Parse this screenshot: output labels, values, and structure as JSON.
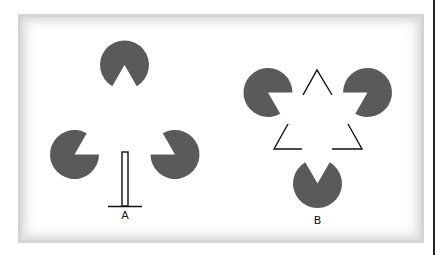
{
  "figure": {
    "colors": {
      "inducer_fill": "#5a5a5a",
      "line": "#111111",
      "frame_border": "#d4d4d4",
      "background": "#ffffff"
    },
    "panels": [
      {
        "id": "A",
        "label": "A",
        "description": "Three pac-man inducers arranged in a triangle around a T-shaped stem",
        "inducers": [
          {
            "cx": 124.5,
            "cy": 65,
            "r": 24.5,
            "mouth_from_deg": 240,
            "mouth_to_deg": 300
          },
          {
            "cx": 74.5,
            "cy": 154.5,
            "r": 24.5,
            "mouth_from_deg": 0,
            "mouth_to_deg": 60
          },
          {
            "cx": 175,
            "cy": 154.5,
            "r": 24.5,
            "mouth_from_deg": 120,
            "mouth_to_deg": 180
          }
        ],
        "stem": {
          "x": 122,
          "y": 152,
          "w": 6,
          "h": 54
        },
        "base": {
          "x1": 108,
          "x2": 142,
          "y": 206
        }
      },
      {
        "id": "B",
        "label": "B",
        "description": "Kanizsa triangle: three pac-man inducers plus a broken outline triangle",
        "inducers": [
          {
            "cx": 268,
            "cy": 92.5,
            "r": 24.5,
            "mouth_from_deg": 300,
            "mouth_to_deg": 360
          },
          {
            "cx": 367.5,
            "cy": 92.5,
            "r": 24.5,
            "mouth_from_deg": 180,
            "mouth_to_deg": 240
          },
          {
            "cx": 317.5,
            "cy": 183.5,
            "r": 24.5,
            "mouth_from_deg": 60,
            "mouth_to_deg": 120
          }
        ],
        "outline_corners": [
          {
            "points": "303,95 317,70 332,95"
          },
          {
            "points": "288,124 274,149 302,149"
          },
          {
            "points": "348,124 362,149 332,149"
          }
        ]
      }
    ]
  }
}
